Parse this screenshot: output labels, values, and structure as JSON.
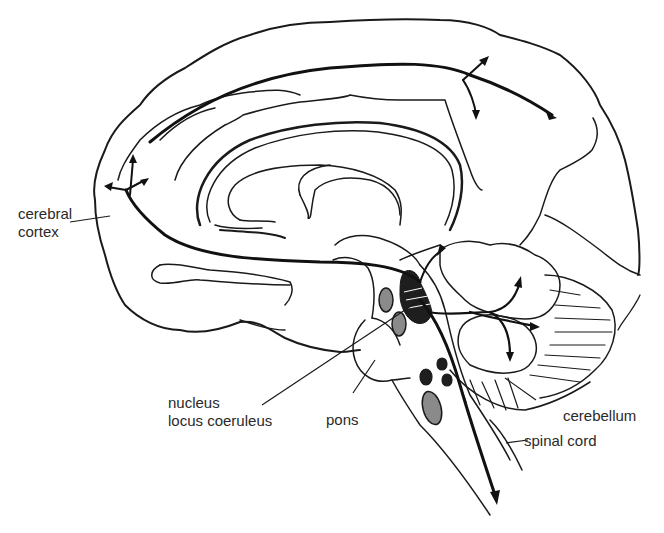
{
  "figure": {
    "colors": {
      "line": "#1a1a1a",
      "background": "#ffffff",
      "nucleus_fill": "#8a8a8a",
      "locus_fill": "#1e1e1e"
    }
  },
  "labels": {
    "cerebral_cortex": {
      "line1": "cerebral",
      "line2": "cortex"
    },
    "nucleus_locus_coeruleus": {
      "line1": "nucleus",
      "line2": "locus coeruleus"
    },
    "pons": "pons",
    "cerebellum": "cerebellum",
    "spinal_cord": "spinal cord"
  },
  "signature": "Kiefer"
}
